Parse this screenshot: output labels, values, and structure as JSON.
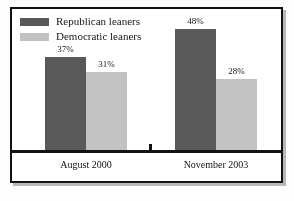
{
  "chart_data": {
    "type": "bar",
    "title": "",
    "subtitle": "",
    "xlabel": "",
    "ylabel": "",
    "ylim": [
      0,
      56
    ],
    "grid": false,
    "legend_position": "top-left",
    "categories": [
      "August 2000",
      "November 2003"
    ],
    "series": [
      {
        "name": "Republican leaners",
        "color": "#595959",
        "values": [
          37,
          48
        ],
        "labels": [
          "37%",
          "48%"
        ]
      },
      {
        "name": "Democratic leaners",
        "color": "#c2c2c2",
        "values": [
          31,
          28
        ],
        "labels": [
          "31%",
          "28%"
        ]
      }
    ]
  },
  "legend": {
    "items": [
      {
        "label": "Republican leaners",
        "color": "#595959"
      },
      {
        "label": "Democratic leaners",
        "color": "#c2c2c2"
      }
    ]
  },
  "axis": {
    "categories": [
      "August 2000",
      "November 2003"
    ]
  }
}
